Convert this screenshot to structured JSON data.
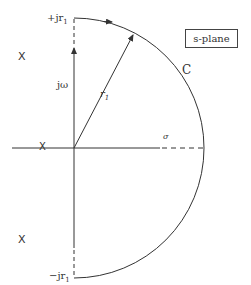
{
  "diagram": {
    "title_box": "s-plane",
    "contour_label": "C",
    "radius_label_base": "r",
    "radius_label_sub": "1",
    "imag_axis_label": "jω",
    "real_axis_label": "σ",
    "top_intercept_label": "+jr",
    "top_intercept_sub": "1",
    "bottom_intercept_label": "−jr",
    "bottom_intercept_sub": "1",
    "pole_marker": "X",
    "poles": [
      {
        "id": "upper-left",
        "marker": "X"
      },
      {
        "id": "real-axis",
        "marker": "X"
      },
      {
        "id": "lower-left",
        "marker": "X"
      }
    ],
    "colors": {
      "stroke": "#333333",
      "background": "#ffffff"
    }
  }
}
